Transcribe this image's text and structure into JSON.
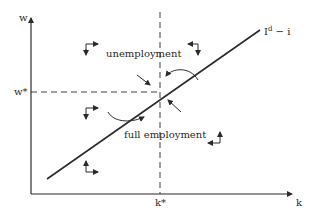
{
  "diagram": {
    "axes": {
      "y_label": "w",
      "x_label": "k",
      "y_equilibrium_label": "w*",
      "x_equilibrium_label": "k*"
    },
    "curve_label": "I",
    "curve_label_sup": "d",
    "curve_label_suffix": " − i",
    "region_labels": {
      "upper": "unemployment",
      "lower": "full employment"
    },
    "colors": {
      "line": "#2a2a2a",
      "background": "#ffffff"
    }
  }
}
